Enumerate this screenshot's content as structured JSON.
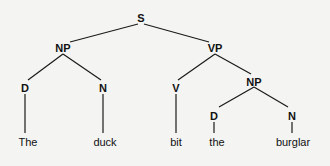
{
  "diagram": {
    "type": "parse-tree",
    "nodes": {
      "s": {
        "label": "S",
        "x": 141,
        "y": 20
      },
      "np1": {
        "label": "NP",
        "x": 63,
        "y": 50
      },
      "vp": {
        "label": "VP",
        "x": 215,
        "y": 50
      },
      "d1": {
        "label": "D",
        "x": 25,
        "y": 90
      },
      "n1": {
        "label": "N",
        "x": 103,
        "y": 90
      },
      "v": {
        "label": "V",
        "x": 176,
        "y": 90
      },
      "np2": {
        "label": "NP",
        "x": 254,
        "y": 84
      },
      "d2": {
        "label": "D",
        "x": 214,
        "y": 118
      },
      "n2": {
        "label": "N",
        "x": 292,
        "y": 118
      }
    },
    "leaves": {
      "w1": {
        "label": "The",
        "x": 28,
        "y": 145
      },
      "w2": {
        "label": "duck",
        "x": 105,
        "y": 145
      },
      "w3": {
        "label": "bit",
        "x": 176,
        "y": 145
      },
      "w4": {
        "label": "the",
        "x": 217,
        "y": 145
      },
      "w5": {
        "label": "burglar",
        "x": 292,
        "y": 145
      }
    },
    "sentence": "The duck bit the burglar"
  }
}
